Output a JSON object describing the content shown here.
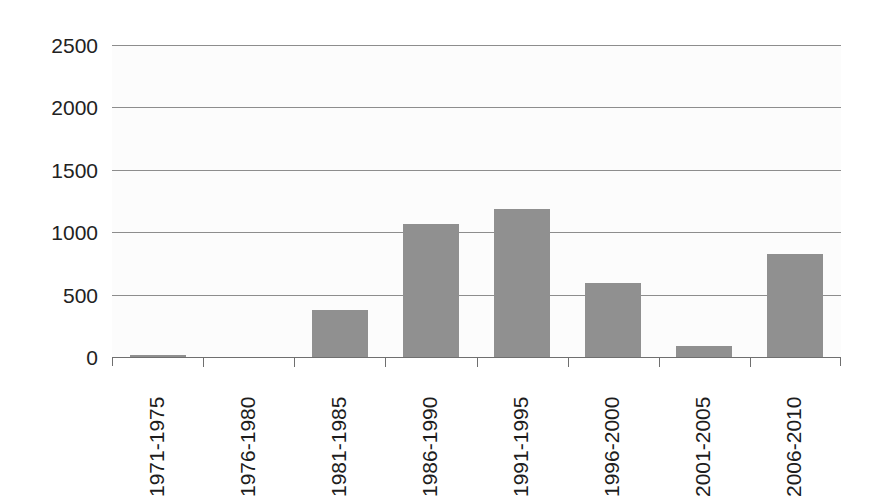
{
  "chart_data": {
    "type": "bar",
    "title": "",
    "subtitle": "",
    "xlabel": "",
    "ylabel": "",
    "categories": [
      "1971-1975",
      "1976-1980",
      "1981-1985",
      "1986-1990",
      "1991-1995",
      "1996-2000",
      "2001-2005",
      "2006-2010"
    ],
    "values": [
      20,
      0,
      380,
      1065,
      1185,
      590,
      85,
      825
    ],
    "series": [
      {
        "name": "",
        "values": [
          20,
          0,
          380,
          1065,
          1185,
          590,
          85,
          825
        ]
      }
    ],
    "ylim": [
      0,
      2500
    ],
    "ytick_labels": [
      "0",
      "500",
      "1000",
      "1500",
      "2000",
      "2500"
    ],
    "ytick_values": [
      0,
      500,
      1000,
      1500,
      2000,
      2500
    ],
    "grid": true,
    "grid_axis": "y",
    "legend": false,
    "legend_position": "none",
    "annotations": [],
    "bar_color": "#909090",
    "gridline_color": "#8d8d8d",
    "axis_color": "#6f6f6f",
    "background_color": "#fcfcfc",
    "tick_label_color": "#222222",
    "xtick_label_rotation": -90
  }
}
